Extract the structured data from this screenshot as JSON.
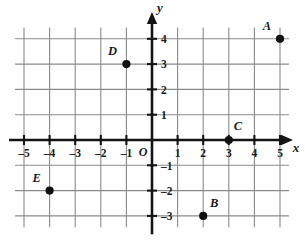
{
  "chart_data": {
    "type": "scatter",
    "title": "",
    "xlabel": "x",
    "ylabel": "y",
    "grid": true,
    "legend": "none",
    "origin_label": "O",
    "xlim": [
      -5.6,
      5.6
    ],
    "ylim": [
      -3.6,
      4.6
    ],
    "xticks": [
      -5,
      -4,
      -3,
      -2,
      -1,
      1,
      2,
      3,
      4,
      5
    ],
    "yticks": [
      -3,
      -2,
      -1,
      1,
      2,
      3,
      4
    ],
    "xtick_labels": [
      "–5",
      "–4",
      "–3",
      "–2",
      "–1",
      "1",
      "2",
      "3",
      "4",
      "5"
    ],
    "ytick_labels": [
      "–3",
      "–2",
      "–1",
      "1",
      "2",
      "3",
      "4"
    ],
    "points": [
      {
        "label": "A",
        "x": 5,
        "y": 4,
        "label_dx": -13,
        "label_dy": -9
      },
      {
        "label": "B",
        "x": 2,
        "y": -3,
        "label_dx": 11,
        "label_dy": -9
      },
      {
        "label": "C",
        "x": 3,
        "y": 0,
        "label_dx": 9,
        "label_dy": -10
      },
      {
        "label": "D",
        "x": -1,
        "y": 3,
        "label_dx": -14,
        "label_dy": -9
      },
      {
        "label": "E",
        "x": -4,
        "y": -2,
        "label_dx": -13,
        "label_dy": -9
      }
    ]
  },
  "colors": {
    "background": "#ffffff",
    "grid": "#8a8a8a",
    "axis": "#141414",
    "point": "#111111",
    "text": "#1a1a1a"
  }
}
